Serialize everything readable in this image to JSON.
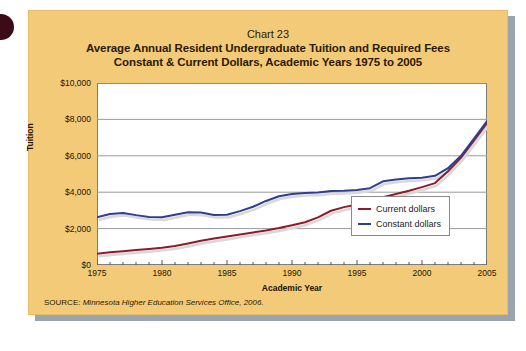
{
  "figure": {
    "chart_number": "Chart 23",
    "title_line1": "Average Annual Resident Undergraduate Tuition and Required Fees",
    "title_line2": "Constant & Current Dollars, Academic Years 1975 to 2005",
    "source_label": "SOURCE:",
    "source_text": "Minnesota Higher Education Services Office, 2006."
  },
  "colors": {
    "panel": "#f3ca78",
    "plot_background": "#ffffff",
    "current_dollars": "#8e1b2c",
    "constant_dollars": "#2e3f8f",
    "gridline": "#9a9a9a",
    "axis": "#7d7d7d",
    "shadow_line": "#d9d9d9"
  },
  "chart_data": {
    "type": "line",
    "title": "Average Annual Resident Undergraduate Tuition and Required Fees",
    "subtitle": "Constant & Current Dollars, Academic Years 1975 to 2005",
    "xlabel": "Academic Year",
    "ylabel": "Tuition",
    "xlim": [
      1975,
      2005
    ],
    "ylim": [
      0,
      10000
    ],
    "ytick_values": [
      0,
      2000,
      4000,
      6000,
      8000,
      10000
    ],
    "ytick_labels": [
      "$0",
      "$2,000",
      "$4,000",
      "$6,000",
      "$8,000",
      "$10,000"
    ],
    "xtick_labels": [
      "1975",
      "1980",
      "1985",
      "1990",
      "1995",
      "2000",
      "2005"
    ],
    "xtick_values": [
      1975,
      1980,
      1985,
      1990,
      1995,
      2000,
      2005
    ],
    "minor_xticks_every": 1,
    "grid": "horizontal",
    "legend_position": "bottom-right",
    "x": [
      1975,
      1976,
      1977,
      1978,
      1979,
      1980,
      1981,
      1982,
      1983,
      1984,
      1985,
      1986,
      1987,
      1988,
      1989,
      1990,
      1991,
      1992,
      1993,
      1994,
      1995,
      1996,
      1997,
      1998,
      1999,
      2000,
      2001,
      2002,
      2003,
      2004,
      2005
    ],
    "series": [
      {
        "name": "Current dollars",
        "color": "#8e1b2c",
        "values": [
          620,
          700,
          760,
          820,
          880,
          950,
          1040,
          1180,
          1330,
          1450,
          1560,
          1680,
          1790,
          1900,
          2030,
          2180,
          2350,
          2620,
          2980,
          3180,
          3320,
          3500,
          3720,
          3900,
          4080,
          4280,
          4500,
          5150,
          5900,
          6850,
          7800
        ]
      },
      {
        "name": "Constant dollars",
        "color": "#2e3f8f",
        "values": [
          2620,
          2800,
          2860,
          2740,
          2640,
          2620,
          2760,
          2900,
          2880,
          2750,
          2760,
          2960,
          3200,
          3520,
          3780,
          3900,
          3960,
          3980,
          4060,
          4080,
          4120,
          4220,
          4600,
          4700,
          4760,
          4800,
          4900,
          5320,
          6000,
          6950,
          7900
        ]
      }
    ]
  },
  "legend": {
    "items": [
      {
        "label": "Current dollars",
        "color": "#8e1b2c"
      },
      {
        "label": "Constant dollars",
        "color": "#2e3f8f"
      }
    ]
  }
}
